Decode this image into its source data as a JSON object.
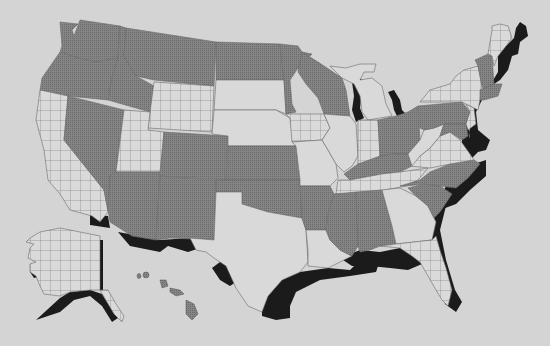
{
  "map": {
    "title": "",
    "background": "#d4d4d4",
    "patterns": {
      "dotted": {
        "name": "gray-dot-pattern",
        "color": "#7c7c7c"
      },
      "grid": {
        "name": "grid-pattern",
        "color": "#d8d8d8",
        "line": "#8a8a8a"
      },
      "plain": {
        "name": "plain-light",
        "color": "#d9d9d9"
      },
      "coast": {
        "name": "coastal-shadow",
        "color": "#1b1b1b"
      }
    },
    "states": [
      {
        "id": "WA",
        "pattern": "dotted"
      },
      {
        "id": "OR",
        "pattern": "dotted"
      },
      {
        "id": "CA",
        "pattern": "grid"
      },
      {
        "id": "NV",
        "pattern": "dotted"
      },
      {
        "id": "ID",
        "pattern": "dotted"
      },
      {
        "id": "MT",
        "pattern": "dotted"
      },
      {
        "id": "WY",
        "pattern": "grid"
      },
      {
        "id": "UT",
        "pattern": "grid"
      },
      {
        "id": "AZ",
        "pattern": "dotted"
      },
      {
        "id": "CO",
        "pattern": "dotted"
      },
      {
        "id": "NM",
        "pattern": "dotted"
      },
      {
        "id": "ND",
        "pattern": "dotted"
      },
      {
        "id": "SD",
        "pattern": "plain"
      },
      {
        "id": "NE",
        "pattern": "plain"
      },
      {
        "id": "KS",
        "pattern": "dotted"
      },
      {
        "id": "OK",
        "pattern": "dotted"
      },
      {
        "id": "TX",
        "pattern": "plain"
      },
      {
        "id": "MN",
        "pattern": "dotted"
      },
      {
        "id": "IA",
        "pattern": "grid"
      },
      {
        "id": "MO",
        "pattern": "plain"
      },
      {
        "id": "AR",
        "pattern": "dotted"
      },
      {
        "id": "LA",
        "pattern": "plain"
      },
      {
        "id": "WI",
        "pattern": "dotted"
      },
      {
        "id": "IL",
        "pattern": "plain"
      },
      {
        "id": "MI",
        "pattern": "plain"
      },
      {
        "id": "IN",
        "pattern": "grid"
      },
      {
        "id": "OH",
        "pattern": "dotted"
      },
      {
        "id": "KY",
        "pattern": "dotted"
      },
      {
        "id": "TN",
        "pattern": "grid"
      },
      {
        "id": "MS",
        "pattern": "dotted"
      },
      {
        "id": "AL",
        "pattern": "dotted"
      },
      {
        "id": "GA",
        "pattern": "plain"
      },
      {
        "id": "FL",
        "pattern": "grid"
      },
      {
        "id": "SC",
        "pattern": "dotted"
      },
      {
        "id": "NC",
        "pattern": "dotted"
      },
      {
        "id": "VA",
        "pattern": "grid"
      },
      {
        "id": "WV",
        "pattern": "plain"
      },
      {
        "id": "PA",
        "pattern": "dotted"
      },
      {
        "id": "NY",
        "pattern": "grid"
      },
      {
        "id": "VT",
        "pattern": "dotted"
      },
      {
        "id": "NH",
        "pattern": "dotted"
      },
      {
        "id": "ME",
        "pattern": "grid"
      },
      {
        "id": "MA",
        "pattern": "dotted"
      },
      {
        "id": "NJ",
        "pattern": "grid"
      },
      {
        "id": "MD",
        "pattern": "dotted"
      },
      {
        "id": "AK",
        "pattern": "grid"
      },
      {
        "id": "HI",
        "pattern": "dotted"
      }
    ]
  }
}
